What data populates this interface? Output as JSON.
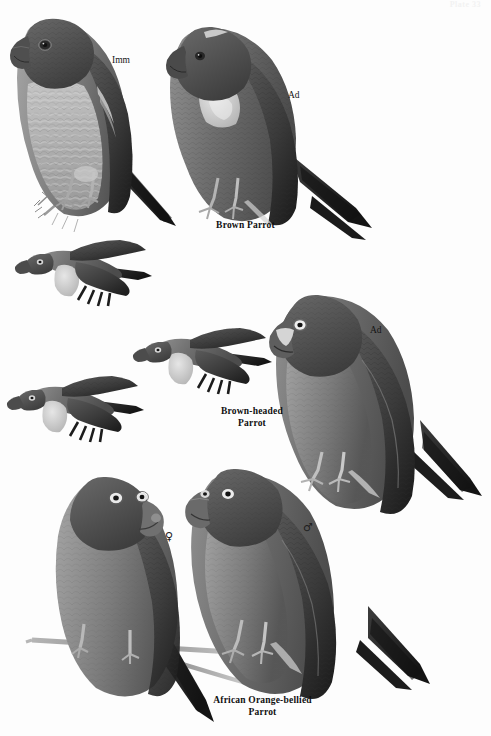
{
  "page": {
    "type": "field-guide-plate",
    "plate_number_label": "Plate 33",
    "background_color": "#fdfdfd",
    "ink_color": "#151515",
    "width": 491,
    "height": 736,
    "medium": "grayscale-painting"
  },
  "species_groups": [
    {
      "caption": "Brown Parrot",
      "caption_lines": [
        "Brown Parrot"
      ],
      "figures": [
        {
          "label": "Imm",
          "pose": "perched",
          "facing": "left"
        },
        {
          "label": "Ad",
          "pose": "perched",
          "facing": "left"
        },
        {
          "label": "",
          "pose": "flying",
          "facing": "left"
        }
      ]
    },
    {
      "caption": "Brown-headed Parrot",
      "caption_lines": [
        "Brown-headed",
        "Parrot"
      ],
      "figures": [
        {
          "label": "Ad",
          "pose": "perched",
          "facing": "left"
        },
        {
          "label": "",
          "pose": "flying",
          "facing": "left"
        },
        {
          "label": "",
          "pose": "flying",
          "facing": "left"
        }
      ]
    },
    {
      "caption": "African Orange-bellied Parrot",
      "caption_lines": [
        "African Orange-bellied",
        "Parrot"
      ],
      "figures": [
        {
          "label": "♀",
          "symbol_name": "female-symbol",
          "pose": "perched",
          "facing": "right"
        },
        {
          "label": "♂",
          "symbol_name": "male-symbol",
          "pose": "perched",
          "facing": "left"
        }
      ]
    }
  ],
  "labels": {
    "imm_top_left": "Imm",
    "ad_top_right": "Ad",
    "ad_middle_right": "Ad",
    "female": "♀",
    "male": "♂"
  },
  "captions": {
    "brown_parrot": "Brown Parrot",
    "brown_headed_line1": "Brown-headed",
    "brown_headed_line2": "Parrot",
    "orange_bellied_line1": "African Orange-bellied",
    "orange_bellied_line2": "Parrot"
  },
  "palette": {
    "paper": "#fdfdfd",
    "plumage_dark": "#4a4a4a",
    "plumage_mid": "#6f6f6f",
    "plumage_light": "#9a9a9a",
    "wing_black": "#262626",
    "patch_pale": "#d6d6d6",
    "belly_pale": "#b9b9b9",
    "beak": "#5c5c5c",
    "perch": "#8d8d8d"
  }
}
